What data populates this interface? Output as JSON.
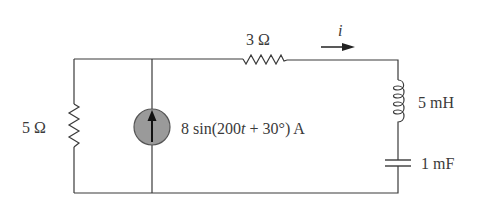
{
  "circuit": {
    "elements": [
      {
        "id": "R1",
        "type": "resistor",
        "label": "5 Ω",
        "value": "5 Ω",
        "orientation": "vertical",
        "branch": "left"
      },
      {
        "id": "Is",
        "type": "current-source",
        "label": "8 sin(200t + 30°) A",
        "label_parts": {
          "pre": "8 sin(200",
          "var": "t",
          "post": " + 30°) A"
        },
        "direction": "up",
        "branch": "middle"
      },
      {
        "id": "R2",
        "type": "resistor",
        "label": "3 Ω",
        "value": "3 Ω",
        "orientation": "horizontal",
        "branch": "top"
      },
      {
        "id": "L1",
        "type": "inductor",
        "label": "5 mH",
        "value": "5 mH",
        "orientation": "vertical",
        "branch": "right"
      },
      {
        "id": "C1",
        "type": "capacitor",
        "label": "1 mF",
        "value": "1 mF",
        "orientation": "vertical",
        "branch": "right"
      }
    ],
    "current": {
      "label": "i",
      "direction": "right"
    },
    "colors": {
      "wire": "#3a3a3a",
      "source_fill": "#9a9a9a",
      "background": "#ffffff"
    }
  }
}
